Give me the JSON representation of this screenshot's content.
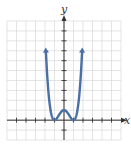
{
  "chart_data": {
    "type": "line",
    "title": "",
    "xlabel": "x",
    "ylabel": "y",
    "function": "y = (x^2 - 1)^2",
    "xlim": [
      -6,
      6
    ],
    "ylim": [
      -2,
      10
    ],
    "grid": true,
    "grid_step": 1,
    "series": [
      {
        "name": "curve",
        "x": [
          -1.9,
          -1.75,
          -1.5,
          -1.25,
          -1.0,
          -0.75,
          -0.5,
          -0.25,
          0,
          0.25,
          0.5,
          0.75,
          1.0,
          1.25,
          1.5,
          1.75,
          1.9
        ],
        "y": [
          6.9,
          4.2,
          1.56,
          0.32,
          0,
          0.19,
          0.56,
          0.88,
          1,
          0.88,
          0.56,
          0.19,
          0,
          0.32,
          1.56,
          4.2,
          6.9
        ],
        "end_arrows": true
      }
    ],
    "key_points": {
      "x_intercepts": [
        [
          -1,
          0
        ],
        [
          1,
          0
        ]
      ],
      "local_max": [
        0,
        1
      ]
    }
  },
  "colors": {
    "curve": "#4a6fa5",
    "grid": "#d8d8d8",
    "axis": "#333333"
  },
  "labels": {
    "x_axis": "x",
    "y_axis": "y"
  }
}
